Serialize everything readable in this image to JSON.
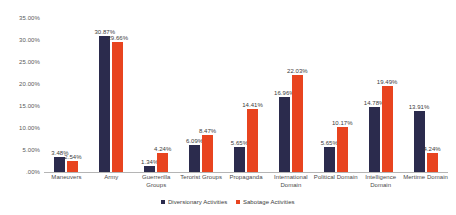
{
  "chart_data": {
    "type": "bar",
    "title": "",
    "xlabel": "",
    "ylabel": "",
    "ylim": [
      0,
      35
    ],
    "grid": false,
    "legend_position": "bottom-center",
    "y_ticks": [
      "35.00%",
      "30.00%",
      "25.00%",
      "20.00%",
      "15.00%",
      "10.00%",
      "5.00%",
      ".00%"
    ],
    "y_tick_values": [
      35,
      30,
      25,
      20,
      15,
      10,
      5,
      0
    ],
    "categories": [
      "Maneuvers",
      "Army",
      "Guerrerilla Groups",
      "Terorist Groups",
      "Propaganda",
      "International Domain",
      "Political Domain",
      "Intelligence Domain",
      "Mertime Domain"
    ],
    "series": [
      {
        "name": "Diversionary Activities",
        "color": "#2b2b4d",
        "values": [
          3.48,
          30.87,
          1.34,
          6.09,
          5.65,
          16.96,
          5.65,
          14.78,
          13.91
        ],
        "labels": [
          "3.48%",
          "30.87%",
          "1.34%",
          "6.09%",
          "5.65%",
          "16.96%",
          "5.65%",
          "14.78%",
          "13.91%"
        ]
      },
      {
        "name": "Sabotage Activities",
        "color": "#e8441f",
        "values": [
          2.54,
          29.66,
          4.24,
          8.47,
          14.41,
          22.03,
          10.17,
          19.49,
          4.24
        ],
        "labels": [
          "2.54%",
          "29.66%",
          "4.24%",
          "8.47%",
          "14.41%",
          "22.03%",
          "10.17%",
          "19.49%",
          "4.24%"
        ]
      }
    ]
  }
}
